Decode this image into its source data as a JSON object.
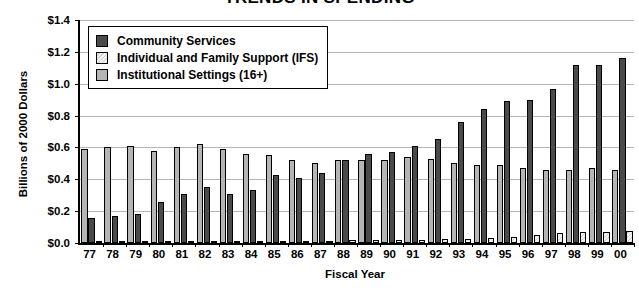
{
  "chart_data": {
    "type": "bar",
    "title": "TRENDS IN SPENDING",
    "xlabel": "Fiscal Year",
    "ylabel": "Billions of 2000 Dollars",
    "ylim": [
      0.0,
      1.4
    ],
    "ytick_values": [
      0.0,
      0.2,
      0.4,
      0.6,
      0.8,
      1.0,
      1.2,
      1.4
    ],
    "ytick_labels": [
      "$0.0",
      "$0.2",
      "$0.4",
      "$0.6",
      "$0.8",
      "$1.0",
      "$1.2",
      "$1.4"
    ],
    "grid": true,
    "legend_position": "upper-left-inside",
    "categories": [
      "77",
      "78",
      "79",
      "80",
      "81",
      "82",
      "83",
      "84",
      "85",
      "86",
      "87",
      "88",
      "89",
      "90",
      "91",
      "92",
      "93",
      "94",
      "95",
      "96",
      "97",
      "98",
      "99",
      "00"
    ],
    "series": [
      {
        "name": "Community Services",
        "color": "#4a4a4a",
        "values": [
          0.16,
          0.17,
          0.18,
          0.26,
          0.31,
          0.35,
          0.31,
          0.33,
          0.43,
          0.41,
          0.44,
          0.52,
          0.56,
          0.57,
          0.61,
          0.65,
          0.76,
          0.84,
          0.89,
          0.9,
          0.97,
          1.12,
          1.12,
          1.16
        ]
      },
      {
        "name": "Individual and Family Support (IFS)",
        "color": "#e8e8e8",
        "values": [
          0.005,
          0.005,
          0.006,
          0.007,
          0.008,
          0.009,
          0.01,
          0.011,
          0.012,
          0.013,
          0.015,
          0.016,
          0.018,
          0.019,
          0.021,
          0.023,
          0.027,
          0.031,
          0.04,
          0.053,
          0.06,
          0.068,
          0.072,
          0.078
        ]
      },
      {
        "name": "Institutional Settings (16+)",
        "color": "#b5b5b5",
        "values": [
          0.59,
          0.6,
          0.61,
          0.58,
          0.6,
          0.62,
          0.59,
          0.56,
          0.55,
          0.52,
          0.5,
          0.52,
          0.52,
          0.52,
          0.54,
          0.53,
          0.5,
          0.49,
          0.49,
          0.47,
          0.46,
          0.46,
          0.47,
          0.46
        ]
      }
    ]
  }
}
